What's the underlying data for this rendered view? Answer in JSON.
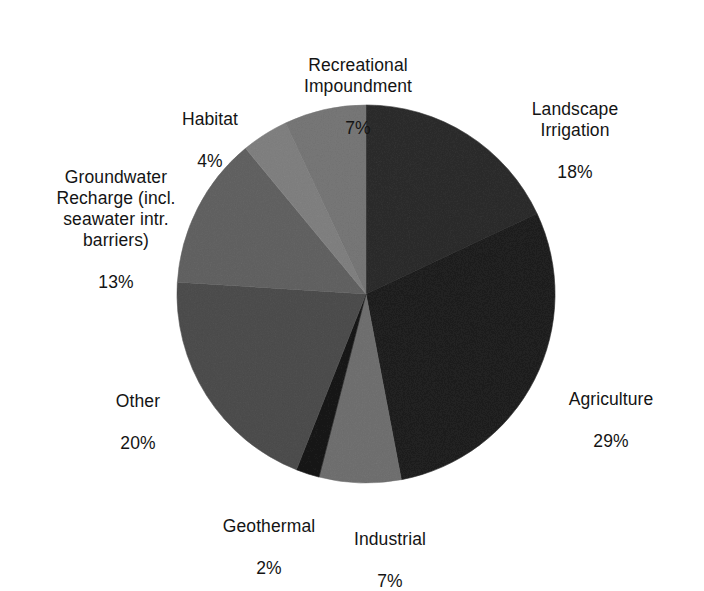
{
  "chart_data": {
    "type": "pie",
    "title": "",
    "subtitle": "",
    "xlabel": "",
    "ylabel": "",
    "legend_position": "none",
    "grid": false,
    "labels_show_percent": true,
    "start_angle_deg": 0,
    "direction": "clockwise",
    "categories": [
      "Landscape Irrigation",
      "Agriculture",
      "Industrial",
      "Geothermal",
      "Other",
      "Groundwater Recharge (incl. seawater intr. barriers)",
      "Habitat",
      "Recreational Impoundment"
    ],
    "values": [
      18,
      29,
      7,
      2,
      20,
      13,
      4,
      7
    ],
    "units": "%",
    "total": 100,
    "slices": [
      {
        "name": "Landscape Irrigation",
        "value": 18,
        "value_text": "18%",
        "color": "#6a6a6a",
        "start_deg": 0,
        "end_deg": 64.8
      },
      {
        "name": "Agriculture",
        "value": 29,
        "value_text": "29%",
        "color": "#5a5a5a",
        "start_deg": 64.8,
        "end_deg": 169.2
      },
      {
        "name": "Industrial",
        "value": 7,
        "value_text": "7%",
        "color": "#a8a8a8",
        "start_deg": 169.2,
        "end_deg": 194.4
      },
      {
        "name": "Geothermal",
        "value": 2,
        "value_text": "2%",
        "color": "#4e4e4e",
        "start_deg": 194.4,
        "end_deg": 201.6
      },
      {
        "name": "Other",
        "value": 20,
        "value_text": "20%",
        "color": "#8b8b8b",
        "start_deg": 201.6,
        "end_deg": 273.6
      },
      {
        "name": "Groundwater Recharge (incl. seawater intr. barriers)",
        "value": 13,
        "value_text": "13%",
        "color": "#9d9d9d",
        "start_deg": 273.6,
        "end_deg": 320.4
      },
      {
        "name": "Habitat",
        "value": 4,
        "value_text": "4%",
        "color": "#b4b4b4",
        "start_deg": 320.4,
        "end_deg": 334.8
      },
      {
        "name": "Recreational Impoundment",
        "value": 7,
        "value_text": "7%",
        "color": "#adadad",
        "start_deg": 334.8,
        "end_deg": 360
      }
    ]
  },
  "labels": {
    "recreational_impoundment": {
      "name": "Recreational\nImpoundment",
      "value": "7%"
    },
    "habitat": {
      "name": "Habitat",
      "value": "4%"
    },
    "groundwater_recharge": {
      "name": "Groundwater\nRecharge (incl.\nseawater intr.\nbarriers)",
      "value": "13%"
    },
    "other": {
      "name": "Other",
      "value": "20%"
    },
    "geothermal": {
      "name": "Geothermal",
      "value": "2%"
    },
    "industrial": {
      "name": "Industrial",
      "value": "7%"
    },
    "landscape_irrigation": {
      "name": "Landscape\nIrrigation",
      "value": "18%"
    },
    "agriculture": {
      "name": "Agriculture",
      "value": "29%"
    }
  },
  "geometry": {
    "center_x": 366,
    "center_y": 294,
    "radius": 189
  },
  "colors": {
    "background": "#ffffff",
    "text": "#141414"
  }
}
